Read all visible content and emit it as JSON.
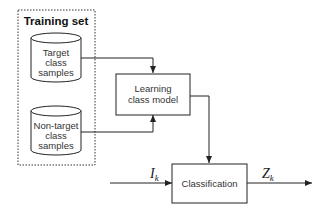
{
  "diagram": {
    "training_set": {
      "title": "Training set",
      "target_db": {
        "line1": "Target",
        "line2": "class",
        "line3": "samples"
      },
      "nontarget_db": {
        "line1": "Non-target",
        "line2": "class",
        "line3": "samples"
      }
    },
    "learning_box": {
      "line1": "Learning",
      "line2": "class model"
    },
    "classification_box": {
      "label": "Classification"
    },
    "input_signal": {
      "symbol": "I",
      "subscript": "k"
    },
    "output_signal": {
      "symbol": "Z",
      "subscript": "k"
    },
    "colors": {
      "stroke": "#222222",
      "text": "#333333",
      "background": "#ffffff"
    }
  }
}
